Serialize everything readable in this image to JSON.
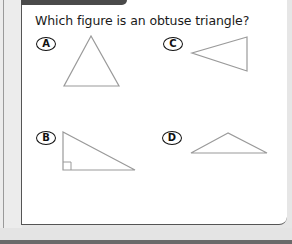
{
  "question": "Which figure is an obtuse triangle?",
  "options": [
    {
      "label": "A",
      "shape": "acute-triangle"
    },
    {
      "label": "B",
      "shape": "right-triangle"
    },
    {
      "label": "C",
      "shape": "acute-triangle-rotated"
    },
    {
      "label": "D",
      "shape": "obtuse-triangle"
    }
  ],
  "colors": {
    "shape_stroke": "#9a9a9a",
    "text": "#1a1a1a",
    "tab": "#4a4a4a",
    "border": "#555555"
  }
}
